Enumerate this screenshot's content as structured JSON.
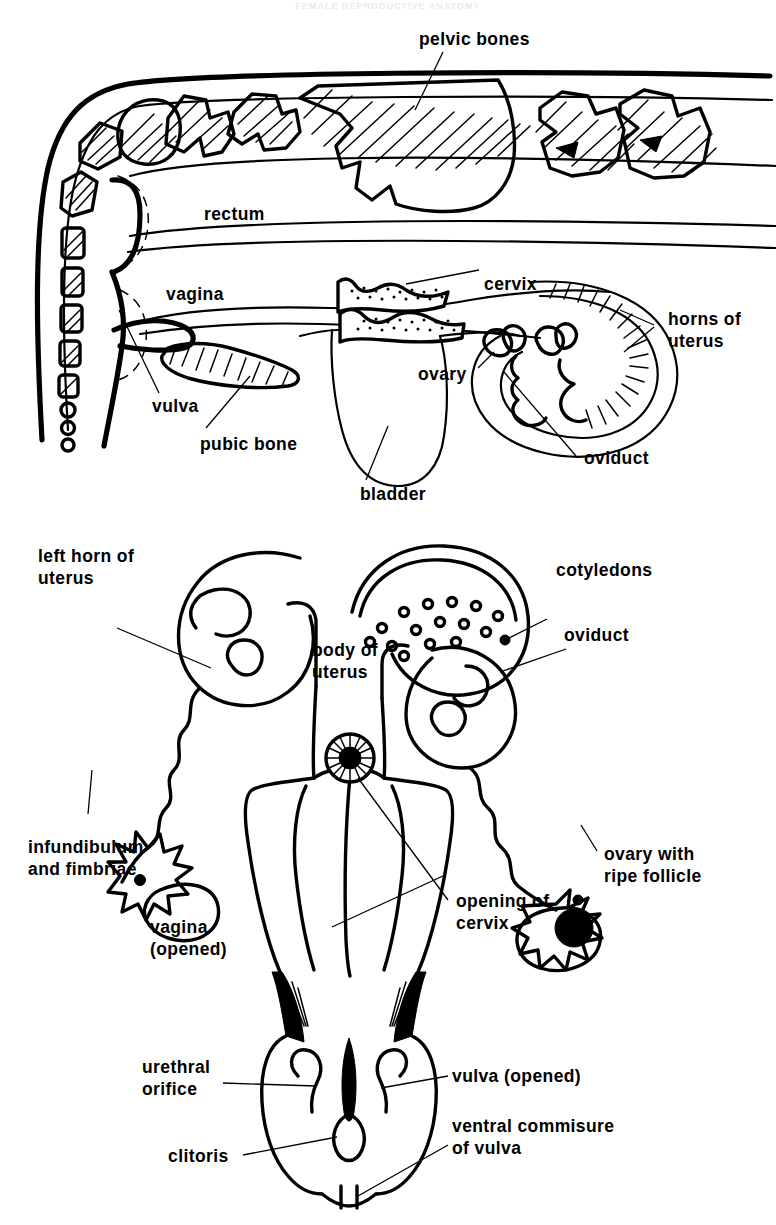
{
  "page": {
    "header_faint": "FEMALE REPRODUCTIVE ANATOMY",
    "background_color": "#ffffff",
    "ink_color": "#000000",
    "width": 776,
    "height": 1225
  },
  "figure_pelvis": {
    "name": "sagittal-section-of-cow-pelvis",
    "labels": {
      "pelvic_bones": "pelvic bones",
      "rectum": "rectum",
      "cervix": "cervix",
      "vagina": "vagina",
      "horns_of_uterus_line1": "horns of",
      "horns_of_uterus_line2": "uterus",
      "vulva": "vulva",
      "pubic_bone": "pubic bone",
      "bladder": "bladder",
      "ovary": "ovary",
      "oviduct": "oviduct"
    }
  },
  "figure_tract": {
    "name": "dorsal-view-of-opened-reproductive-tract",
    "labels": {
      "left_horn_line1": "left horn of",
      "left_horn_line2": "uterus",
      "cotyledons": "cotyledons",
      "body_of_uterus_line1": "body of",
      "body_of_uterus_line2": "uterus",
      "oviduct": "oviduct",
      "infundibulum_line1": "infundibulum",
      "infundibulum_line2": "and  fimbriae",
      "ovary_line1": "ovary with",
      "ovary_line2": "ripe follicle",
      "vagina_line1": "vagina",
      "vagina_line2": "(opened)",
      "opening_cervix_line1": "opening of",
      "opening_cervix_line2": "cervix",
      "urethral_line1": "urethral",
      "urethral_line2": "orifice",
      "vulva_opened": "vulva (opened)",
      "ventral_line1": "ventral commisure",
      "ventral_line2": "of vulva",
      "clitoris": "clitoris"
    }
  },
  "icons": {
    "cotyledon_dot": "circle-dot-icon",
    "ripe_follicle": "filled-circle-icon",
    "cervix_rosette": "rosette-icon"
  }
}
